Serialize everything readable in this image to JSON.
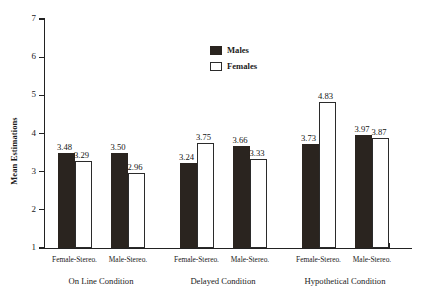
{
  "chart_data": {
    "type": "bar",
    "title": "",
    "xlabel": "",
    "ylabel": "Mean Estimations",
    "ylim": [
      1,
      7
    ],
    "yticks": [
      1,
      2,
      3,
      4,
      5,
      6,
      7
    ],
    "grid": false,
    "legend_position": "top-center",
    "categories": [
      "Female-Stereo.",
      "Male-Stereo.",
      "Female-Stereo.",
      "Male-Stereo.",
      "Female-Stereo.",
      "Male-Stereo."
    ],
    "groups": [
      {
        "label": "On Line Condition",
        "categories": [
          "Female-Stereo.",
          "Male-Stereo."
        ]
      },
      {
        "label": "Delayed Condition",
        "categories": [
          "Female-Stereo.",
          "Male-Stereo."
        ]
      },
      {
        "label": "Hypothetical Condition",
        "categories": [
          "Female-Stereo.",
          "Male-Stereo."
        ]
      }
    ],
    "series": [
      {
        "name": "Males",
        "color": "#2a241f",
        "values": [
          3.48,
          3.5,
          3.24,
          3.66,
          3.73,
          3.97
        ]
      },
      {
        "name": "Females",
        "color": "#ffffff",
        "values": [
          3.29,
          2.96,
          3.75,
          3.33,
          4.83,
          3.87
        ]
      }
    ]
  },
  "legend": {
    "items": [
      {
        "label": "Males",
        "style": "filled"
      },
      {
        "label": "Females",
        "style": "outlined"
      }
    ]
  },
  "axis": {
    "y_title": "Mean Estimations",
    "y_tick_labels": [
      "1",
      "2",
      "3",
      "4",
      "5",
      "6",
      "7"
    ]
  },
  "bar_labels": [
    "3.48",
    "3.29",
    "3.50",
    "2.96",
    "3.24",
    "3.75",
    "3.66",
    "3.33",
    "3.73",
    "4.83",
    "3.97",
    "3.87"
  ],
  "x_tick_labels": [
    "Female-Stereo.",
    "Male-Stereo.",
    "Female-Stereo.",
    "Male-Stereo.",
    "Female-Stereo.",
    "Male-Stereo."
  ],
  "group_labels": [
    "On Line Condition",
    "Delayed Condition",
    "Hypothetical Condition"
  ]
}
